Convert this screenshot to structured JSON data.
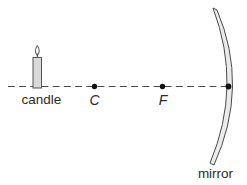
{
  "diagram": {
    "labels": {
      "candle": "candle",
      "center": "C",
      "focus": "F",
      "mirror": "mirror"
    },
    "colors": {
      "background": "#ffffff",
      "line": "#4a4a4a",
      "text": "#2b2b2b",
      "dot": "#111111",
      "candle_fill": "#d9d9d9",
      "mirror_fill": "#ebebeb",
      "flame_fill": "#ffffff"
    }
  }
}
